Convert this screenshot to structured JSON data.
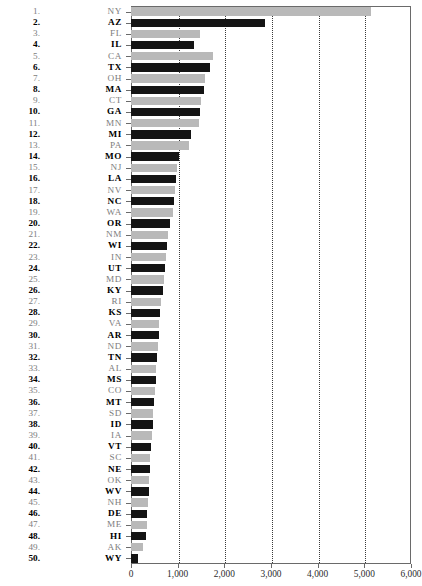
{
  "chart_data": {
    "type": "bar",
    "orientation": "horizontal",
    "title": "",
    "subtitle": "",
    "xlabel": "",
    "ylabel": "",
    "xlim": [
      0,
      6000
    ],
    "xticks": [
      0,
      1000,
      2000,
      3000,
      4000,
      5000,
      6000
    ],
    "xtick_labels": [
      "0",
      "1,000",
      "2,000",
      "3,000",
      "4,000",
      "5,000",
      "6,000"
    ],
    "grid": true,
    "gridlines_at": [
      1000,
      2000,
      3000,
      4000,
      5000
    ],
    "legend": "none",
    "colors": {
      "bar_dark": "#141414",
      "bar_light": "#b9b9b9",
      "axis": "#6a6a6a",
      "gridline": "#3a3a3a",
      "label_dark": "#000000",
      "label_light": "#7d7d7d"
    },
    "note": "Alternating bar shading: odd ranks light gray, even ranks black.",
    "categories": [
      "NY",
      "AZ",
      "FL",
      "IL",
      "CA",
      "TX",
      "OH",
      "MA",
      "CT",
      "GA",
      "MN",
      "MI",
      "PA",
      "MO",
      "NJ",
      "LA",
      "NV",
      "NC",
      "WA",
      "OR",
      "NM",
      "WI",
      "IN",
      "UT",
      "MD",
      "KY",
      "RI",
      "KS",
      "VA",
      "AR",
      "ND",
      "TN",
      "AL",
      "MS",
      "CO",
      "MT",
      "SD",
      "ID",
      "IA",
      "VT",
      "SC",
      "NE",
      "OK",
      "WV",
      "NH",
      "DE",
      "ME",
      "HI",
      "AK",
      "WY"
    ],
    "ranks": [
      1,
      2,
      3,
      4,
      5,
      6,
      7,
      8,
      9,
      10,
      11,
      12,
      13,
      14,
      15,
      16,
      17,
      18,
      19,
      20,
      21,
      22,
      23,
      24,
      25,
      26,
      27,
      28,
      29,
      30,
      31,
      32,
      33,
      34,
      35,
      36,
      37,
      38,
      39,
      40,
      41,
      42,
      43,
      44,
      45,
      46,
      47,
      48,
      49,
      50
    ],
    "values": [
      5150,
      2870,
      1480,
      1350,
      1760,
      1700,
      1580,
      1560,
      1500,
      1480,
      1450,
      1290,
      1250,
      1020,
      990,
      960,
      940,
      920,
      900,
      830,
      790,
      770,
      740,
      720,
      700,
      680,
      640,
      620,
      600,
      590,
      570,
      560,
      540,
      530,
      510,
      500,
      480,
      470,
      450,
      430,
      410,
      400,
      390,
      380,
      360,
      350,
      340,
      320,
      260,
      150
    ]
  },
  "rows": [
    {
      "rank": "1.",
      "state": "NY",
      "value": 5150,
      "shade": "light"
    },
    {
      "rank": "2.",
      "state": "AZ",
      "value": 2870,
      "shade": "dark"
    },
    {
      "rank": "3.",
      "state": "FL",
      "value": 1480,
      "shade": "light"
    },
    {
      "rank": "4.",
      "state": "IL",
      "value": 1350,
      "shade": "dark"
    },
    {
      "rank": "5.",
      "state": "CA",
      "value": 1760,
      "shade": "light"
    },
    {
      "rank": "6.",
      "state": "TX",
      "value": 1700,
      "shade": "dark"
    },
    {
      "rank": "7.",
      "state": "OH",
      "value": 1580,
      "shade": "light"
    },
    {
      "rank": "8.",
      "state": "MA",
      "value": 1560,
      "shade": "dark"
    },
    {
      "rank": "9.",
      "state": "CT",
      "value": 1500,
      "shade": "light"
    },
    {
      "rank": "10.",
      "state": "GA",
      "value": 1480,
      "shade": "dark"
    },
    {
      "rank": "11.",
      "state": "MN",
      "value": 1450,
      "shade": "light"
    },
    {
      "rank": "12.",
      "state": "MI",
      "value": 1290,
      "shade": "dark"
    },
    {
      "rank": "13.",
      "state": "PA",
      "value": 1250,
      "shade": "light"
    },
    {
      "rank": "14.",
      "state": "MO",
      "value": 1020,
      "shade": "dark"
    },
    {
      "rank": "15.",
      "state": "NJ",
      "value": 990,
      "shade": "light"
    },
    {
      "rank": "16.",
      "state": "LA",
      "value": 960,
      "shade": "dark"
    },
    {
      "rank": "17.",
      "state": "NV",
      "value": 940,
      "shade": "light"
    },
    {
      "rank": "18.",
      "state": "NC",
      "value": 920,
      "shade": "dark"
    },
    {
      "rank": "19.",
      "state": "WA",
      "value": 900,
      "shade": "light"
    },
    {
      "rank": "20.",
      "state": "OR",
      "value": 830,
      "shade": "dark"
    },
    {
      "rank": "21.",
      "state": "NM",
      "value": 790,
      "shade": "light"
    },
    {
      "rank": "22.",
      "state": "WI",
      "value": 770,
      "shade": "dark"
    },
    {
      "rank": "23.",
      "state": "IN",
      "value": 740,
      "shade": "light"
    },
    {
      "rank": "24.",
      "state": "UT",
      "value": 720,
      "shade": "dark"
    },
    {
      "rank": "25.",
      "state": "MD",
      "value": 700,
      "shade": "light"
    },
    {
      "rank": "26.",
      "state": "KY",
      "value": 680,
      "shade": "dark"
    },
    {
      "rank": "27.",
      "state": "RI",
      "value": 640,
      "shade": "light"
    },
    {
      "rank": "28.",
      "state": "KS",
      "value": 620,
      "shade": "dark"
    },
    {
      "rank": "29.",
      "state": "VA",
      "value": 600,
      "shade": "light"
    },
    {
      "rank": "30.",
      "state": "AR",
      "value": 590,
      "shade": "dark"
    },
    {
      "rank": "31.",
      "state": "ND",
      "value": 570,
      "shade": "light"
    },
    {
      "rank": "32.",
      "state": "TN",
      "value": 560,
      "shade": "dark"
    },
    {
      "rank": "33.",
      "state": "AL",
      "value": 540,
      "shade": "light"
    },
    {
      "rank": "34.",
      "state": "MS",
      "value": 530,
      "shade": "dark"
    },
    {
      "rank": "35.",
      "state": "CO",
      "value": 510,
      "shade": "light"
    },
    {
      "rank": "36.",
      "state": "MT",
      "value": 500,
      "shade": "dark"
    },
    {
      "rank": "37.",
      "state": "SD",
      "value": 480,
      "shade": "light"
    },
    {
      "rank": "38.",
      "state": "ID",
      "value": 470,
      "shade": "dark"
    },
    {
      "rank": "39.",
      "state": "IA",
      "value": 450,
      "shade": "light"
    },
    {
      "rank": "40.",
      "state": "VT",
      "value": 430,
      "shade": "dark"
    },
    {
      "rank": "41.",
      "state": "SC",
      "value": 410,
      "shade": "light"
    },
    {
      "rank": "42.",
      "state": "NE",
      "value": 400,
      "shade": "dark"
    },
    {
      "rank": "43.",
      "state": "OK",
      "value": 390,
      "shade": "light"
    },
    {
      "rank": "44.",
      "state": "WV",
      "value": 380,
      "shade": "dark"
    },
    {
      "rank": "45.",
      "state": "NH",
      "value": 360,
      "shade": "light"
    },
    {
      "rank": "46.",
      "state": "DE",
      "value": 350,
      "shade": "dark"
    },
    {
      "rank": "47.",
      "state": "ME",
      "value": 340,
      "shade": "light"
    },
    {
      "rank": "48.",
      "state": "HI",
      "value": 320,
      "shade": "dark"
    },
    {
      "rank": "49.",
      "state": "AK",
      "value": 260,
      "shade": "light"
    },
    {
      "rank": "50.",
      "state": "WY",
      "value": 150,
      "shade": "dark"
    }
  ]
}
